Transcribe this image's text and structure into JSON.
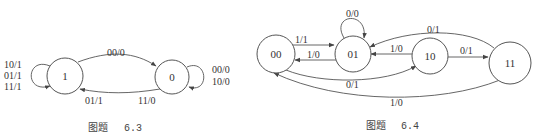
{
  "figures": [
    {
      "id": "6.3",
      "caption_prefix": "图题",
      "caption_number": "6.3",
      "states": [
        {
          "name": "1",
          "label": "1"
        },
        {
          "name": "0",
          "label": "0"
        }
      ],
      "transitions": {
        "self_1": [
          "10/1",
          "01/1",
          "11/1"
        ],
        "self_0": [
          "00/0",
          "10/0"
        ],
        "1_to_0": "00/0",
        "0_to_1_a": "01/1",
        "0_to_1_b": "11/0"
      }
    },
    {
      "id": "6.4",
      "caption_prefix": "图题",
      "caption_number": "6.4",
      "states": [
        {
          "name": "00",
          "label": "00"
        },
        {
          "name": "01",
          "label": "01"
        },
        {
          "name": "10",
          "label": "10"
        },
        {
          "name": "11",
          "label": "11"
        }
      ],
      "transitions": {
        "self_01": "0/0",
        "00_to_01": "1/1",
        "01_to_00": "1/0",
        "10_to_01": "1/0",
        "10_to_11": "0/1",
        "11_to_01": "0/1",
        "00_to_10": "0/1",
        "11_to_00": "1/0"
      }
    }
  ]
}
